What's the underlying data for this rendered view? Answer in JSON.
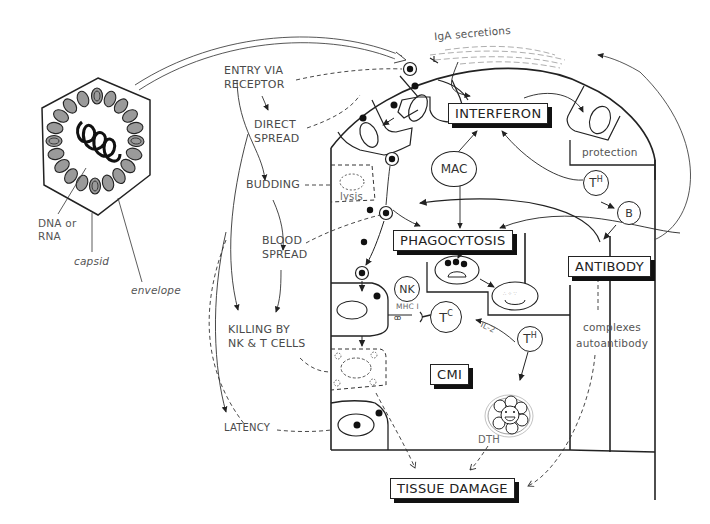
{
  "diagram": {
    "virus": {
      "labels": {
        "genome": "DNA or\nRNA",
        "genome_line1": "DNA or",
        "genome_line2": "RNA",
        "capsid": "capsid",
        "envelope": "envelope"
      }
    },
    "pathway_labels": {
      "entry_line1": "ENTRY VIA",
      "entry_line2": "RECEPTOR",
      "direct_line1": "DIRECT",
      "direct_line2": "SPREAD",
      "budding": "BUDDING",
      "blood_line1": "BLOOD",
      "blood_line2": "SPREAD",
      "killing_line1": "KILLING BY",
      "killing_line2": "NK & T CELLS",
      "latency": "LATENCY"
    },
    "boxed_terms": {
      "interferon": "INTERFERON",
      "phagocytosis": "PHAGOCYTOSIS",
      "antibody": "ANTIBODY",
      "cmi": "CMI",
      "tissue_damage": "TISSUE DAMAGE"
    },
    "cells": {
      "mac": "MAC",
      "nk": "NK",
      "tc_base": "T",
      "tc_sup": "C",
      "th_base": "T",
      "th_sup": "H",
      "b": "B"
    },
    "annotations": {
      "iga": "IgA secretions",
      "protection": "protection",
      "lysis": "lysis",
      "mhc": "MHC I",
      "il2": "IL-2",
      "dth": "DTH",
      "complexes": "complexes",
      "autoantibody": "autoantibody"
    },
    "colors": {
      "ink": "#222222",
      "text": "#444444",
      "capsomere_fill": "#9a9a9a",
      "shadow": "#111111",
      "background": "#ffffff"
    }
  }
}
